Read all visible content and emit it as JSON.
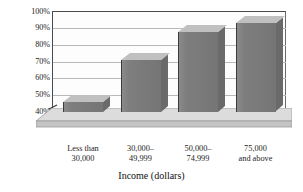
{
  "chart_data": {
    "type": "bar",
    "title": "",
    "subtitle": "",
    "xlabel": "Income (dollars)",
    "ylabel": "",
    "categories": [
      "Less than 30,000",
      "30,000–49,999",
      "50,000–74,999",
      "75,000 and above"
    ],
    "category_lines": [
      [
        "Less than",
        "30,000"
      ],
      [
        "30,000–",
        "49,999"
      ],
      [
        "50,000–",
        "74,999"
      ],
      [
        "75,000",
        "and above"
      ]
    ],
    "values": [
      46,
      71,
      88,
      93
    ],
    "value_unit": "%",
    "ylim": [
      40,
      100
    ],
    "ytick_values": [
      100,
      90,
      80,
      70,
      60,
      50,
      40
    ],
    "ytick_labels": [
      "100%",
      "90%",
      "80%",
      "70%",
      "60%",
      "50%",
      "40%"
    ],
    "grid": true,
    "legend": "none",
    "axis_break": true,
    "style": "3d-column",
    "colors": {
      "bar_front": "#7c7c7c",
      "bar_top": "#c0c0c0",
      "bar_side": "#6a6a6a",
      "gridline": "#b9b9b9",
      "axis": "#4a4a4a",
      "floor": "#d2d2d2",
      "background": "#ffffff",
      "text": "#1d1d1d"
    }
  },
  "axis": {
    "break_icon": "axis-break-zigzag-icon"
  }
}
